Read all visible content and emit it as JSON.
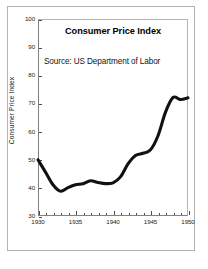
{
  "figure": {
    "background_color": "#ffffff",
    "frame_color": "#b3b3b3",
    "axis_color": "#808080",
    "line_color": "#111111"
  },
  "chart_data": {
    "type": "line",
    "title": "Consumer Price Index",
    "annotation": "Source: US Department of Labor",
    "xlabel": "",
    "ylabel": "Consumer Price Index",
    "xlim": [
      1930,
      1950
    ],
    "ylim": [
      30,
      100
    ],
    "grid": false,
    "legend": "none",
    "xticks": [
      1930,
      1935,
      1940,
      1945,
      1950
    ],
    "xtick_labels": [
      "1930",
      "1935",
      "1940",
      "1945",
      "1950"
    ],
    "xminor_step": 1,
    "yticks": [
      30,
      40,
      50,
      60,
      70,
      80,
      90,
      100
    ],
    "ytick_labels": [
      "30",
      "40",
      "50",
      "60",
      "70",
      "80",
      "90",
      "100"
    ],
    "x": [
      1930,
      1931,
      1932,
      1933,
      1934,
      1935,
      1936,
      1937,
      1938,
      1939,
      1940,
      1941,
      1942,
      1943,
      1944,
      1945,
      1946,
      1947,
      1948,
      1949,
      1950
    ],
    "values": [
      50.0,
      45.6,
      41.1,
      38.8,
      40.1,
      41.1,
      41.5,
      42.5,
      41.9,
      41.5,
      41.8,
      43.9,
      48.5,
      51.5,
      52.3,
      53.5,
      58.5,
      66.9,
      72.1,
      71.4,
      72.0
    ],
    "series": [
      {
        "name": "Consumer Price Index",
        "values": [
          50.0,
          45.6,
          41.1,
          38.8,
          40.1,
          41.1,
          41.5,
          42.5,
          41.9,
          41.5,
          41.8,
          43.9,
          48.5,
          51.5,
          52.3,
          53.5,
          58.5,
          66.9,
          72.1,
          71.4,
          72.0
        ]
      }
    ]
  }
}
